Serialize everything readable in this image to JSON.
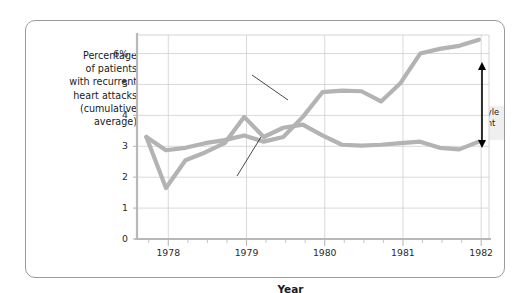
{
  "chart_data": {
    "type": "line",
    "title": "",
    "xlabel": "Year",
    "ylabel": "Percentage of patients with recurrent heart attacks (cumulative average)",
    "ylabel_lines": [
      "Percentage",
      "of patients",
      "with recurrent",
      "heart attacks",
      "(cumulative",
      "average)"
    ],
    "ylim": [
      0,
      6.6
    ],
    "xlim": [
      1977.6,
      1982.1
    ],
    "yticks": [
      0,
      1,
      2,
      3,
      4,
      5,
      6
    ],
    "ytick_labels": [
      "0",
      "1",
      "2",
      "3",
      "4",
      "5",
      "6%"
    ],
    "xticks": [
      1978,
      1979,
      1980,
      1981,
      1982
    ],
    "xtick_labels": [
      "1978",
      "1979",
      "1980",
      "1981",
      "1982"
    ],
    "minor_xticks_per_year": 4,
    "grid": "both",
    "legend": "inline-labels",
    "series": [
      {
        "name": "Control patients",
        "color": "#b3b3b3",
        "x": [
          1977.72,
          1977.97,
          1978.22,
          1978.47,
          1978.72,
          1978.97,
          1979.22,
          1979.47,
          1979.72,
          1979.97,
          1980.22,
          1980.47,
          1980.72,
          1980.97,
          1981.22,
          1981.47,
          1981.72,
          1981.97
        ],
        "values": [
          3.3,
          2.87,
          2.95,
          3.1,
          3.2,
          3.35,
          3.15,
          3.3,
          3.95,
          4.75,
          4.8,
          4.78,
          4.45,
          5.05,
          6.0,
          6.15,
          6.25,
          6.45
        ]
      },
      {
        "name": "Life-style modification patients",
        "color": "#b3b3b3",
        "x": [
          1977.72,
          1977.97,
          1978.22,
          1978.47,
          1978.72,
          1978.97,
          1979.22,
          1979.47,
          1979.72,
          1979.97,
          1980.22,
          1980.47,
          1980.72,
          1980.97,
          1981.22,
          1981.47,
          1981.72,
          1981.97
        ],
        "values": [
          3.3,
          1.65,
          2.55,
          2.8,
          3.1,
          3.95,
          3.3,
          3.6,
          3.7,
          3.35,
          3.05,
          3.02,
          3.05,
          3.1,
          3.15,
          2.95,
          2.9,
          3.15
        ]
      }
    ],
    "annotations": [
      {
        "name": "lifestyle-benefit-note",
        "text": "Modifying life-style reduced recurrent heart attacks",
        "lines": [
          "Modifying life-style",
          "reduced recurrent",
          "heart attacks"
        ]
      }
    ],
    "series_labels": [
      {
        "name": "control-label",
        "text": "Control patients"
      },
      {
        "name": "lifestyle-label",
        "text": "Life-style modification patients"
      }
    ],
    "colors": {
      "line": "#b3b3b3",
      "grid": "#cfcfcf",
      "axis": "#b8b8b8",
      "frame": "#9a9a9a",
      "text": "#1b1b1b",
      "arrow": "#000000"
    }
  }
}
